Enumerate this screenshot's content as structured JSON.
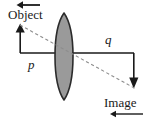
{
  "figure": {
    "background_color": "#ffffff",
    "width": 153,
    "height": 123
  },
  "labels": {
    "object": "Object",
    "image": "Image",
    "object_distance": "p",
    "image_distance": "q"
  },
  "icons": {
    "object_motion_arrow": "arrow-left-icon",
    "image_motion_arrow": "arrow-left-icon",
    "object_height_arrow": "arrow-up-icon",
    "image_height_arrow": "arrow-down-icon"
  },
  "colors": {
    "stroke": "#1a1a1a",
    "lens_fill": "#9a9a9a",
    "lens_stroke": "#2b2b2b",
    "ray_dashed": "#8d8d8d"
  },
  "geometry": {
    "optical_axis": {
      "x1": 20,
      "y1": 53,
      "x2": 134,
      "y2": 53
    },
    "object_arrow": {
      "x": 20,
      "y_base": 53,
      "y_tip": 25
    },
    "image_arrow": {
      "x": 134,
      "y_base": 53,
      "y_tip": 88
    },
    "lens": {
      "cx": 64,
      "cy": 56,
      "half_width": 12,
      "top": 13,
      "bottom": 100
    },
    "ray": {
      "x1": 20,
      "y1": 25,
      "x2": 134,
      "y2": 88
    },
    "object_motion_arrow": {
      "x_tail": 40,
      "x_head": 17,
      "y": 5
    },
    "image_motion_arrow": {
      "x_tail": 143,
      "x_head": 110,
      "y": 114
    }
  }
}
